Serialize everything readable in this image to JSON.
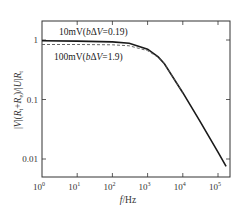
{
  "chart_data": {
    "type": "line",
    "title": "",
    "xlabel": "f/Hz",
    "ylabel": "|V|(R_t+R_e)/|U|R_t",
    "xscale": "log",
    "yscale": "log",
    "xlim": [
      1,
      200000
    ],
    "ylim": [
      0.004,
      1.7
    ],
    "grid": false,
    "x_ticks": [
      1,
      10,
      100,
      1000,
      10000,
      100000
    ],
    "x_tick_labels": [
      "10^0",
      "10^1",
      "10^2",
      "10^3",
      "10^4",
      "10^5"
    ],
    "y_ticks": [
      1,
      0.1,
      0.01
    ],
    "y_tick_labels": [
      "1",
      "0.1",
      "0.01"
    ],
    "series": [
      {
        "name": "10mV(bΔV=0.19)",
        "style": "solid",
        "color": "#1a1a1a",
        "x": [
          1,
          10,
          100,
          300,
          1000,
          2000,
          3000,
          10000,
          30000,
          100000,
          170000
        ],
        "y": [
          0.97,
          0.96,
          0.93,
          0.88,
          0.7,
          0.52,
          0.4,
          0.13,
          0.044,
          0.013,
          0.0075
        ]
      },
      {
        "name": "100mV(bΔV=1.9)",
        "style": "dashed",
        "color": "#555555",
        "x": [
          1,
          10,
          100,
          300,
          1000,
          2000,
          3000,
          10000
        ],
        "y": [
          0.84,
          0.84,
          0.83,
          0.8,
          0.66,
          0.51,
          0.4,
          0.13
        ]
      }
    ],
    "annotations": [
      {
        "text": "10mV(bΔV=0.19)",
        "near": "solid curve, above"
      },
      {
        "text": "100mV(bΔV=1.9)",
        "near": "dashed curve, below"
      }
    ]
  },
  "labels": {
    "x_axis": "f/Hz",
    "ann_solid_prefix": "10mV(",
    "ann_solid_b": "b",
    "ann_solid_mid": "Δ",
    "ann_solid_v": "V",
    "ann_solid_suffix": "=0.19)",
    "ann_dash_prefix": "100mV(",
    "ann_dash_b": "b",
    "ann_dash_mid": "Δ",
    "ann_dash_v": "V",
    "ann_dash_suffix": "=1.9)"
  }
}
